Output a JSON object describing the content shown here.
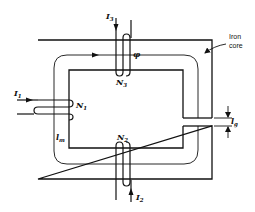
{
  "figure": {
    "type": "magnetic-circuit"
  },
  "labels": {
    "core_note_line1": "Iron",
    "core_note_line2": "core",
    "flux": "φ",
    "mean_length": "l",
    "mean_length_sub": "m",
    "gap_length": "l",
    "gap_length_sub": "g"
  },
  "windings": [
    {
      "id": "N1",
      "name": "N",
      "sub": "1",
      "current": "I",
      "current_sub": "1",
      "location": "left leg"
    },
    {
      "id": "N2",
      "name": "N",
      "sub": "2",
      "current": "I",
      "current_sub": "2",
      "location": "bottom yoke"
    },
    {
      "id": "N3",
      "name": "N",
      "sub": "3",
      "current": "I",
      "current_sub": "3",
      "location": "top yoke"
    }
  ],
  "colors": {
    "line": "#111111",
    "background": "#ffffff"
  }
}
